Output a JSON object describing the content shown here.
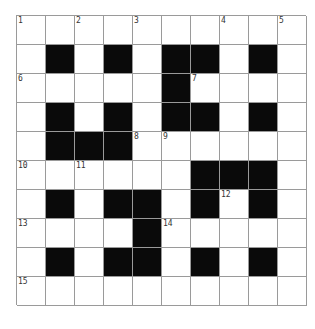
{
  "puzzle": {
    "rows": 10,
    "cols": 10,
    "colors": {
      "black": "#0a0a0a",
      "white": "#ffffff",
      "grid_line": "#9a9a9a",
      "number": "#333333"
    },
    "layout": [
      "..........",
      ".#.#.##.#.",
      ".....#....",
      ".#.#.##.#.",
      ".###......",
      "......###.",
      ".#.##.#.#.",
      "....#.....",
      ".#.##.#.#.",
      ".........."
    ],
    "numbers": [
      {
        "row": 0,
        "col": 0,
        "n": "1"
      },
      {
        "row": 0,
        "col": 2,
        "n": "2"
      },
      {
        "row": 0,
        "col": 4,
        "n": "3"
      },
      {
        "row": 0,
        "col": 7,
        "n": "4"
      },
      {
        "row": 0,
        "col": 9,
        "n": "5"
      },
      {
        "row": 2,
        "col": 0,
        "n": "6"
      },
      {
        "row": 2,
        "col": 6,
        "n": "7"
      },
      {
        "row": 4,
        "col": 4,
        "n": "8"
      },
      {
        "row": 4,
        "col": 5,
        "n": "9"
      },
      {
        "row": 5,
        "col": 0,
        "n": "10"
      },
      {
        "row": 5,
        "col": 2,
        "n": "11"
      },
      {
        "row": 6,
        "col": 7,
        "n": "12"
      },
      {
        "row": 7,
        "col": 0,
        "n": "13"
      },
      {
        "row": 7,
        "col": 5,
        "n": "14"
      },
      {
        "row": 9,
        "col": 0,
        "n": "15"
      }
    ]
  }
}
